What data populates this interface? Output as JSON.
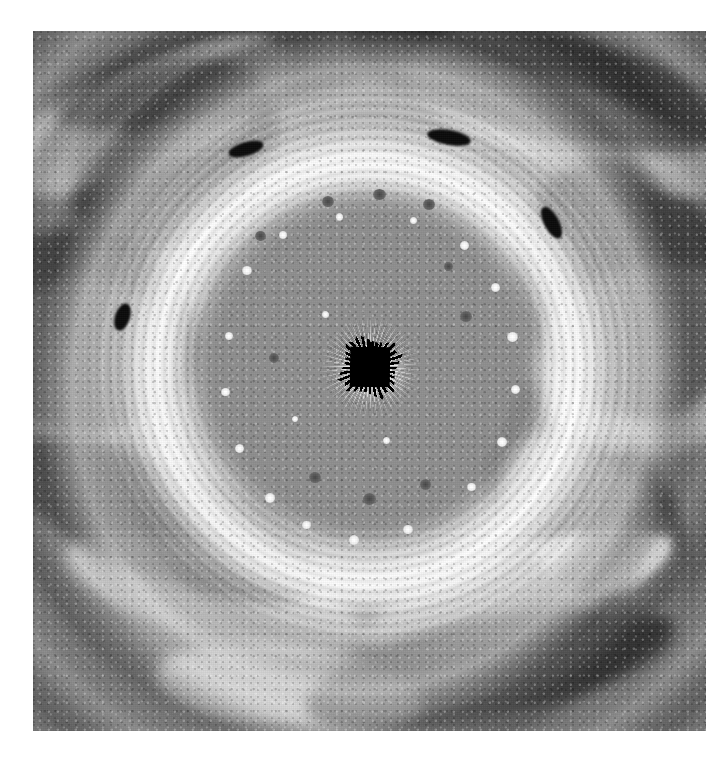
{
  "page": {
    "background_color": "#ffffff",
    "width_px": 717,
    "height_px": 767,
    "caption": ""
  },
  "plate": {
    "label": "polar-projection-image",
    "left_px": 33,
    "top_px": 31,
    "width_px": 673,
    "height_px": 700,
    "color_mode": "grayscale",
    "description": "Polar stereographic projection of a giant planet's polar region showing concentric swirling cloud bands, a mottled polar cap, a bright collar ring, dark oval vortices and a black square data gap at the pole."
  },
  "chart_data": {
    "type": "heatmap",
    "title": "",
    "subtitle": "",
    "xlabel": "",
    "ylabel": "",
    "grid": false,
    "legend": "none",
    "colormap": "grayscale",
    "projection": "polar-stereographic",
    "pole_center": {
      "x_pct": 50,
      "y_pct": 48
    },
    "annotations": [],
    "radial_zones": [
      {
        "name": "pole-data-gap",
        "r_start_pct": 0,
        "r_end_pct": 3,
        "mean_gray": "#000000"
      },
      {
        "name": "inner-polar-cap",
        "r_start_pct": 3,
        "r_end_pct": 26,
        "mean_gray": "#8d8d8d"
      },
      {
        "name": "cap-margin",
        "r_start_pct": 26,
        "r_end_pct": 31,
        "mean_gray": "#a2a2a2"
      },
      {
        "name": "bright-collar-ring",
        "r_start_pct": 31,
        "r_end_pct": 45,
        "mean_gray": "#ededed"
      },
      {
        "name": "dark-annulus",
        "r_start_pct": 45,
        "r_end_pct": 60,
        "mean_gray": "#646464"
      },
      {
        "name": "outer-band-zone",
        "r_start_pct": 60,
        "r_end_pct": 85,
        "mean_gray": "#8b8b8b"
      },
      {
        "name": "turbulent-edge",
        "r_start_pct": 85,
        "r_end_pct": 100,
        "mean_gray": "#7c7c7c"
      }
    ],
    "dark_ovals": [
      {
        "id": "vortex-1",
        "x_pct": 31.5,
        "y_pct": 16.5,
        "w_pct": 5.4,
        "h_pct": 2.0,
        "angle_deg": -16
      },
      {
        "id": "vortex-2",
        "x_pct": 61.5,
        "y_pct": 15.0,
        "w_pct": 6.5,
        "h_pct": 2.2,
        "angle_deg": 10
      },
      {
        "id": "vortex-3",
        "x_pct": 77.0,
        "y_pct": 27.0,
        "w_pct": 2.3,
        "h_pct": 5.0,
        "angle_deg": -28
      },
      {
        "id": "vortex-4",
        "x_pct": 13.0,
        "y_pct": 40.5,
        "w_pct": 2.2,
        "h_pct": 4.0,
        "angle_deg": 18
      }
    ],
    "bright_spot_count": 34,
    "dark_spot_count": 26,
    "value_range_gray": [
      0,
      255
    ]
  },
  "features": {
    "center_gap": {
      "name": "pole-data-gap",
      "shape": "square",
      "size_px": 40,
      "fill": "#000000"
    },
    "collar": {
      "name": "bright-collar-ring",
      "fill": "#f2f2f2"
    },
    "background": {
      "name": "cloud-band-field",
      "fill": "#8c8c8c"
    }
  }
}
